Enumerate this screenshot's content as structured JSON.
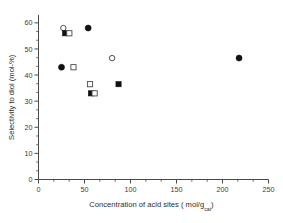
{
  "chart_data": {
    "type": "scatter",
    "title": "",
    "xlabel": "Concentration of acid sites ( mol/g",
    "xlabel_subscript": "cat",
    "xlabel_tail": ")",
    "ylabel": "Selectivity to diol (mol-%)",
    "xlim": [
      0,
      250
    ],
    "ylim": [
      0,
      63
    ],
    "xticks": [
      0,
      50,
      100,
      150,
      200,
      250
    ],
    "xticklabels": [
      "0",
      "50",
      "100",
      "150",
      "200",
      "250"
    ],
    "yticks": [
      0,
      10,
      20,
      30,
      40,
      50,
      60
    ],
    "yticklabels": [
      "0",
      "10",
      "20",
      "30",
      "40",
      "50",
      "60"
    ],
    "x_minor_per_interval": 2,
    "y_minor_per_interval": 2,
    "grid": false,
    "legend": "none",
    "frame": "left-bottom",
    "series": [
      {
        "name": "filled-circle",
        "marker": "filled-circle",
        "points": [
          {
            "x": 25.0,
            "y": 43.0
          },
          {
            "x": 54.0,
            "y": 58.0
          },
          {
            "x": 218.0,
            "y": 46.5
          }
        ]
      },
      {
        "name": "open-circle",
        "marker": "open-circle",
        "points": [
          {
            "x": 27.0,
            "y": 58.0
          },
          {
            "x": 80.0,
            "y": 46.5
          }
        ]
      },
      {
        "name": "filled-square",
        "marker": "filled-square",
        "points": [
          {
            "x": 29.0,
            "y": 56.0
          },
          {
            "x": 57.0,
            "y": 33.0
          },
          {
            "x": 87.0,
            "y": 36.5
          }
        ]
      },
      {
        "name": "open-square",
        "marker": "open-square",
        "points": [
          {
            "x": 33.5,
            "y": 56.0
          },
          {
            "x": 38.0,
            "y": 43.0
          },
          {
            "x": 56.0,
            "y": 36.5
          },
          {
            "x": 61.0,
            "y": 33.0
          }
        ]
      }
    ]
  },
  "colors": {
    "axis": "#4a4a4a",
    "marker_fill": "#111111",
    "marker_open": "#ffffff",
    "background": "#ffffff"
  }
}
